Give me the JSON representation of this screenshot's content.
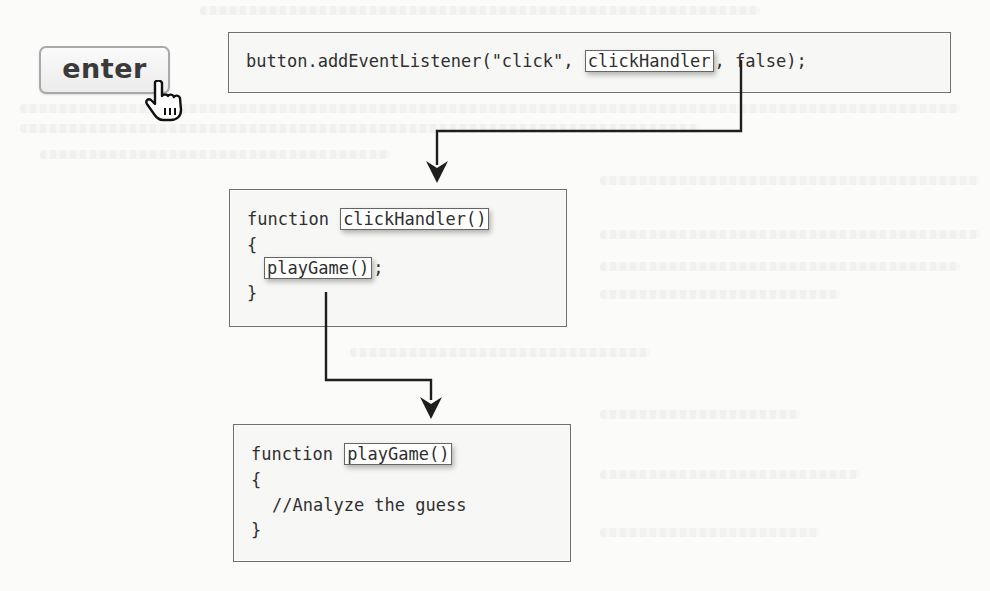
{
  "button": {
    "label": "enter",
    "cursor_icon": "pointing-hand-cursor"
  },
  "boxes": {
    "listener": {
      "prefix": "button.addEventListener(\"click\", ",
      "highlight": "clickHandler",
      "suffix": ", false);"
    },
    "click_handler": {
      "keyword": "function ",
      "name_highlight": "clickHandler()",
      "open_brace": "{",
      "call_highlight": "playGame()",
      "call_suffix": ";",
      "close_brace": "}"
    },
    "play_game": {
      "keyword": "function ",
      "name_highlight": "playGame()",
      "open_brace": "{",
      "comment": "//Analyze the guess",
      "close_brace": "}"
    }
  },
  "arrows": [
    {
      "from": "listener.clickHandler",
      "to": "click_handler"
    },
    {
      "from": "click_handler.playGame",
      "to": "play_game"
    }
  ],
  "colors": {
    "background": "#fbfbfa",
    "box_border": "#6f6f6f",
    "arrow": "#1e1e1e",
    "button_border": "#a9a9a9"
  }
}
